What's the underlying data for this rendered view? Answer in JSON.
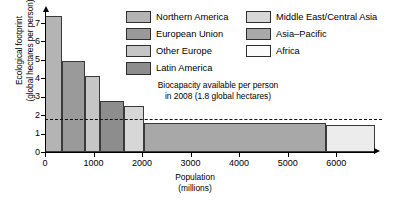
{
  "chart_data": {
    "type": "bar",
    "title": "",
    "subtitle": "",
    "xlabel": "Population",
    "xlabel_unit": "(millions)",
    "ylabel": "Ecological footprint",
    "ylabel_unit": "(global hectares per person)",
    "xlim": [
      0,
      6800
    ],
    "ylim": [
      0,
      7.6
    ],
    "xticks": [
      0,
      1000,
      2000,
      3000,
      4000,
      5000,
      6000
    ],
    "yticks": [
      0,
      1,
      2,
      3,
      4,
      5,
      6,
      7
    ],
    "grid": false,
    "legend_position": "top-right",
    "variable_width_bars": true,
    "categories": [
      "Northern America",
      "European Union",
      "Other Europe",
      "Latin America",
      "Middle East/Central Asia",
      "Asia–Pacific",
      "Africa"
    ],
    "series": [
      {
        "name": "Ecological footprint (global hectares per person)",
        "values": [
          7.4,
          4.95,
          4.15,
          2.75,
          2.5,
          1.6,
          1.45
        ]
      },
      {
        "name": "Population (millions)",
        "values": [
          340,
          490,
          300,
          490,
          410,
          3770,
          1000
        ]
      }
    ],
    "bars": [
      {
        "label": "Northern America",
        "x_start": 0,
        "x_end": 340,
        "population": 340,
        "value": 7.4,
        "color": "#b4b4b4"
      },
      {
        "label": "European Union",
        "x_start": 340,
        "x_end": 830,
        "population": 490,
        "value": 4.95,
        "color": "#9a9a9a"
      },
      {
        "label": "Other Europe",
        "x_start": 830,
        "x_end": 1130,
        "population": 300,
        "value": 4.15,
        "color": "#c6c6c6"
      },
      {
        "label": "Latin America",
        "x_start": 1130,
        "x_end": 1620,
        "population": 490,
        "value": 2.75,
        "color": "#8d8d8d"
      },
      {
        "label": "Middle East/Central Asia",
        "x_start": 1620,
        "x_end": 2030,
        "population": 410,
        "value": 2.5,
        "color": "#d7d7d7"
      },
      {
        "label": "Asia–Pacific",
        "x_start": 2030,
        "x_end": 5800,
        "population": 3770,
        "value": 1.6,
        "color": "#a8a8a8"
      },
      {
        "label": "Africa",
        "x_start": 5800,
        "x_end": 6800,
        "population": 1000,
        "value": 1.45,
        "color": "#ececec"
      }
    ],
    "reference_line": {
      "value": 1.8,
      "style": "dashed",
      "annotation_line1": "Biocapacity available per person",
      "annotation_line2": "in 2008 (1.8 global hectares)"
    }
  },
  "axes": {
    "y_title_line1": "Ecological footprint",
    "y_title_line2": "(global hectares per person)",
    "x_title_line1": "Population",
    "x_title_line2": "(millions)",
    "x_tick_labels": [
      "0",
      "1000",
      "2000",
      "3000",
      "4000",
      "5000",
      "6000"
    ],
    "y_tick_labels": [
      "0",
      "1",
      "2",
      "3",
      "4",
      "5",
      "6",
      "7"
    ]
  },
  "legend": {
    "column1": [
      {
        "label": "Northern America",
        "color": "#b4b4b4"
      },
      {
        "label": "European Union",
        "color": "#9a9a9a"
      },
      {
        "label": "Other Europe",
        "color": "#c6c6c6"
      },
      {
        "label": "Latin America",
        "color": "#8d8d8d"
      }
    ],
    "column2": [
      {
        "label": "Middle East/Central Asia",
        "color": "#d7d7d7"
      },
      {
        "label": "Asia–Pacific",
        "color": "#a8a8a8"
      },
      {
        "label": "Africa",
        "color": "#fbfbfb"
      }
    ]
  },
  "annotation": {
    "line1": "Biocapacity available per person",
    "line2": "in 2008 (1.8 global hectares)"
  },
  "colors": {
    "axis": "#000000",
    "bar_border": "#3a3a3a",
    "background": "#ffffff",
    "reference_line": "#111111"
  }
}
